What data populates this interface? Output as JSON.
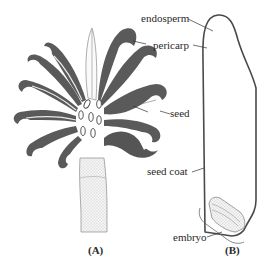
{
  "figure": {
    "panel_a": {
      "label": "(A)",
      "subject": "fruit-with-seeds"
    },
    "panel_b": {
      "label": "(B)",
      "subject": "seed-longitudinal-section"
    },
    "labels": {
      "endosperm": "endosperm",
      "pericarp": "pericarp",
      "seed": "seed",
      "seed_coat": "seed coat",
      "embryo": "embryo"
    },
    "colors": {
      "outline": "#555555",
      "stroke_dark": "#3a3a3a",
      "stipple": "#bdbdbd",
      "background": "#ffffff"
    }
  }
}
